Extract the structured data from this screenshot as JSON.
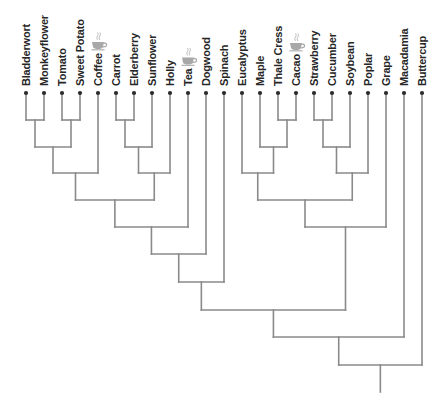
{
  "diagram": {
    "type": "cladogram",
    "orientation": "root-bottom, leaves-top",
    "colors": {
      "edge": "#8a8a8a",
      "label": "#262626",
      "dot": "#2a2a2a",
      "cup": "#a8a8a8"
    },
    "leaf_y": 93,
    "label_end_y": 86,
    "leaves": [
      {
        "id": "bladderwort",
        "label": "Bladderwort",
        "x": 26,
        "icon": null
      },
      {
        "id": "monkeyflower",
        "label": "Monkeyflower",
        "x": 44,
        "icon": null
      },
      {
        "id": "tomato",
        "label": "Tomato",
        "x": 62,
        "icon": null
      },
      {
        "id": "sweet-potato",
        "label": "Sweet Potato",
        "x": 80,
        "icon": null
      },
      {
        "id": "coffee",
        "label": "Coffee",
        "x": 98,
        "icon": "coffee-cup-icon"
      },
      {
        "id": "carrot",
        "label": "Carrot",
        "x": 116,
        "icon": null
      },
      {
        "id": "elderberry",
        "label": "Elderberry",
        "x": 134,
        "icon": null
      },
      {
        "id": "sunflower",
        "label": "Sunflower",
        "x": 152,
        "icon": null
      },
      {
        "id": "holly",
        "label": "Holly",
        "x": 170,
        "icon": null
      },
      {
        "id": "tea",
        "label": "Tea",
        "x": 188,
        "icon": "coffee-cup-icon"
      },
      {
        "id": "dogwood",
        "label": "Dogwood",
        "x": 206,
        "icon": null
      },
      {
        "id": "spinach",
        "label": "Spinach",
        "x": 224,
        "icon": null
      },
      {
        "id": "eucalyptus",
        "label": "Eucalyptus",
        "x": 242,
        "icon": null
      },
      {
        "id": "maple",
        "label": "Maple",
        "x": 260,
        "icon": null
      },
      {
        "id": "thale-cress",
        "label": "Thale Cress",
        "x": 278,
        "icon": null
      },
      {
        "id": "cacao",
        "label": "Cacao",
        "x": 296,
        "icon": "coffee-cup-icon"
      },
      {
        "id": "strawberry",
        "label": "Strawberry",
        "x": 314,
        "icon": null
      },
      {
        "id": "cucumber",
        "label": "Cucumber",
        "x": 332,
        "icon": null
      },
      {
        "id": "soybean",
        "label": "Soybean",
        "x": 350,
        "icon": null
      },
      {
        "id": "poplar",
        "label": "Poplar",
        "x": 368,
        "icon": null
      },
      {
        "id": "grape",
        "label": "Grape",
        "x": 386,
        "icon": null
      },
      {
        "id": "macadamia",
        "label": "Macadamia",
        "x": 404,
        "icon": null
      },
      {
        "id": "buttercup",
        "label": "Buttercup",
        "x": 422,
        "icon": null
      }
    ],
    "nodes": [
      {
        "id": "n1",
        "y": 120,
        "children": [
          "bladderwort",
          "monkeyflower"
        ]
      },
      {
        "id": "n2",
        "y": 120,
        "children": [
          "tomato",
          "sweet-potato"
        ]
      },
      {
        "id": "n3",
        "y": 147,
        "children": [
          "n1",
          "n2"
        ]
      },
      {
        "id": "n4",
        "y": 173,
        "children": [
          "n3",
          "coffee"
        ]
      },
      {
        "id": "n5",
        "y": 120,
        "children": [
          "carrot",
          "elderberry"
        ]
      },
      {
        "id": "n6",
        "y": 147,
        "children": [
          "n5",
          "sunflower"
        ]
      },
      {
        "id": "n7",
        "y": 173,
        "children": [
          "n6",
          "holly"
        ]
      },
      {
        "id": "n8",
        "y": 200,
        "children": [
          "n4",
          "n7"
        ]
      },
      {
        "id": "n9",
        "y": 227,
        "children": [
          "n8",
          "tea"
        ]
      },
      {
        "id": "n10",
        "y": 254,
        "children": [
          "n9",
          "dogwood"
        ]
      },
      {
        "id": "n11",
        "y": 282,
        "children": [
          "n10",
          "spinach"
        ]
      },
      {
        "id": "n12",
        "y": 120,
        "children": [
          "thale-cress",
          "cacao"
        ]
      },
      {
        "id": "n13",
        "y": 147,
        "children": [
          "maple",
          "n12"
        ]
      },
      {
        "id": "n14",
        "y": 173,
        "children": [
          "eucalyptus",
          "n13"
        ]
      },
      {
        "id": "n15",
        "y": 120,
        "children": [
          "strawberry",
          "cucumber"
        ]
      },
      {
        "id": "n16",
        "y": 147,
        "children": [
          "n15",
          "soybean"
        ]
      },
      {
        "id": "n17",
        "y": 173,
        "children": [
          "n16",
          "poplar"
        ]
      },
      {
        "id": "n18",
        "y": 200,
        "children": [
          "n14",
          "n17"
        ]
      },
      {
        "id": "n19",
        "y": 227,
        "children": [
          "n18",
          "grape"
        ]
      },
      {
        "id": "n20",
        "y": 310,
        "children": [
          "n11",
          "n19"
        ]
      },
      {
        "id": "n21",
        "y": 337,
        "children": [
          "n20",
          "macadamia"
        ]
      },
      {
        "id": "root",
        "y": 365,
        "children": [
          "n21",
          "buttercup"
        ]
      }
    ],
    "root_id": "root",
    "root_tail_y": 392
  }
}
